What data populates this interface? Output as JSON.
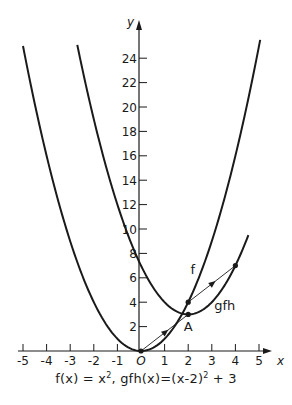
{
  "chart_data": {
    "type": "line",
    "title": "",
    "caption": {
      "f_part": "f(x) = x",
      "f_exp": "2",
      "sep": ", ",
      "g_part": "gfh(x)=(x-2)",
      "g_exp": "2",
      "g_tail": " + 3"
    },
    "xlabel": "x",
    "ylabel": "y",
    "xlim": [
      -5.2,
      5.6
    ],
    "ylim": [
      0,
      26
    ],
    "x_ticks": [
      -5,
      -4,
      -3,
      -2,
      -1,
      0,
      1,
      2,
      3,
      4,
      5
    ],
    "x_tick_labels": [
      "-5",
      "-4",
      "-3",
      "-2",
      "-1",
      "O",
      "1",
      "2",
      "3",
      "4",
      "5"
    ],
    "y_ticks": [
      2,
      4,
      6,
      8,
      10,
      12,
      14,
      16,
      18,
      20,
      22,
      24
    ],
    "y_tick_labels": [
      "2",
      "4",
      "6",
      "8",
      "10",
      "12",
      "14",
      "16",
      "18",
      "20",
      "22",
      "24"
    ],
    "grid": false,
    "series": [
      {
        "name": "f",
        "formula": "x^2",
        "x_range": [
          -5,
          5.05
        ],
        "label": "f",
        "label_pos": [
          2.1,
          6.3
        ]
      },
      {
        "name": "gfh",
        "formula": "(x-2)^2+3",
        "x_range": [
          -2.7,
          4.55
        ],
        "label": "gfh",
        "label_pos": [
          3.1,
          3.4
        ]
      }
    ],
    "points": [
      {
        "x": 0,
        "y": 0,
        "label": ""
      },
      {
        "x": 2,
        "y": 4,
        "label": ""
      },
      {
        "x": 2,
        "y": 3,
        "label": "A",
        "label_pos": [
          2.0,
          1.6
        ]
      },
      {
        "x": 4,
        "y": 7,
        "label": ""
      }
    ],
    "vectors": [
      {
        "from": [
          0,
          0
        ],
        "to": [
          2,
          3
        ],
        "label": "translation (2,3)"
      },
      {
        "from": [
          2,
          4
        ],
        "to": [
          4,
          7
        ],
        "label": "translation (2,3)"
      }
    ],
    "colors": {
      "ink": "#1a1a1a",
      "background": "#ffffff"
    }
  }
}
